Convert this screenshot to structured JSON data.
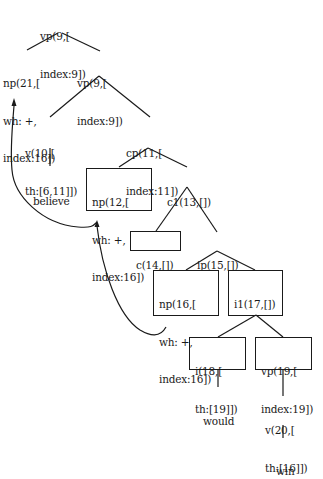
{
  "diagram": {
    "type": "syntax-tree",
    "nodes": [
      {
        "id": "n9a",
        "lines": [
          "vp(9,[",
          "index:9])"
        ],
        "boxed": false
      },
      {
        "id": "n21",
        "lines": [
          "np(21,[",
          "wh: +,",
          "index:16])"
        ],
        "boxed": false
      },
      {
        "id": "n9b",
        "lines": [
          "vp(9,[",
          "index:9])"
        ],
        "boxed": false
      },
      {
        "id": "n10",
        "lines": [
          "v(10,[",
          "th:[6,11]])"
        ],
        "boxed": false
      },
      {
        "id": "n11",
        "lines": [
          "cp(11,[",
          "index:11])"
        ],
        "boxed": false
      },
      {
        "id": "believe",
        "lines": [
          "believe"
        ],
        "boxed": false
      },
      {
        "id": "n12",
        "lines": [
          "np(12,[",
          "wh: +,",
          "index:16])"
        ],
        "boxed": true
      },
      {
        "id": "n13",
        "lines": [
          "c1(13,[])"
        ],
        "boxed": false
      },
      {
        "id": "n14",
        "lines": [
          "c(14,[])"
        ],
        "boxed": true
      },
      {
        "id": "n15",
        "lines": [
          "ip(15,[])"
        ],
        "boxed": false
      },
      {
        "id": "n16",
        "lines": [
          "np(16,[",
          "wh: +,",
          "index:16])"
        ],
        "boxed": true
      },
      {
        "id": "n17",
        "lines": [
          "i1(17,[])"
        ],
        "boxed": true
      },
      {
        "id": "n18",
        "lines": [
          "i(18,[",
          "th:[19]])"
        ],
        "boxed": true
      },
      {
        "id": "n19",
        "lines": [
          "vp(19,[",
          "index:19])"
        ],
        "boxed": true
      },
      {
        "id": "would",
        "lines": [
          "would"
        ],
        "boxed": false
      },
      {
        "id": "n20",
        "lines": [
          "v(20,[",
          "th:[16]])"
        ],
        "boxed": false
      },
      {
        "id": "win",
        "lines": [
          "win"
        ],
        "boxed": false
      }
    ],
    "edges": [
      [
        "n9a",
        "n21"
      ],
      [
        "n9a",
        "n9b"
      ],
      [
        "n9b",
        "n10"
      ],
      [
        "n9b",
        "n11"
      ],
      [
        "n10",
        "believe"
      ],
      [
        "n11",
        "n12"
      ],
      [
        "n11",
        "n13"
      ],
      [
        "n13",
        "n14"
      ],
      [
        "n13",
        "n15"
      ],
      [
        "n15",
        "n16"
      ],
      [
        "n15",
        "n17"
      ],
      [
        "n17",
        "n18"
      ],
      [
        "n17",
        "n19"
      ],
      [
        "n18",
        "would"
      ],
      [
        "n19",
        "n20"
      ],
      [
        "n20",
        "win"
      ]
    ],
    "movement_arrows": [
      {
        "from": "n16",
        "to": "n12",
        "style": "curved"
      },
      {
        "from": "n12",
        "to": "n21",
        "style": "curved"
      }
    ],
    "colors": {
      "ink": "#1a1a1a",
      "background": "#ffffff"
    }
  }
}
